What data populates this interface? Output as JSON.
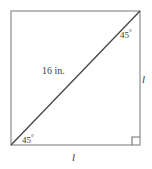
{
  "figure": {
    "kind": "geometry-diagram",
    "background_color": "#ffffff",
    "square": {
      "stroke_color": "#8c8c8c",
      "stroke_width": 1.2,
      "x": 11,
      "y": 11,
      "width": 129,
      "height": 134
    },
    "diagonal": {
      "stroke_color": "#444444",
      "stroke_width": 1.3,
      "x1": 11,
      "y1": 145,
      "x2": 140,
      "y2": 11
    },
    "right_angle_marker": {
      "stroke_color": "#6f6f6f",
      "stroke_width": 1.1,
      "size": 8,
      "corner_x": 140,
      "corner_y": 145
    },
    "labels": {
      "hypotenuse": "16 in.",
      "angle_top_right_value": "45",
      "angle_top_right_degree": "°",
      "angle_bottom_left_value": "45",
      "angle_bottom_left_degree": "°",
      "side_right": "l",
      "side_bottom": "l"
    }
  }
}
